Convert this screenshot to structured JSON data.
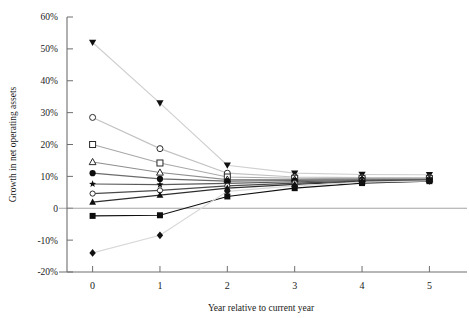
{
  "chart_data": {
    "type": "line",
    "title": "",
    "xlabel": "Year relative to current year",
    "ylabel": "Growth in net operating assets",
    "x": [
      0,
      1,
      2,
      3,
      4,
      5
    ],
    "xlim": [
      -0.38,
      5.38
    ],
    "ylim": [
      -20,
      60
    ],
    "grid": false,
    "legend": "none",
    "xtick_labels": [
      "0",
      "1",
      "2",
      "3",
      "4",
      "5"
    ],
    "ytick_values": [
      60,
      50,
      40,
      30,
      20,
      10,
      0,
      -10,
      -20
    ],
    "ytick_labels": [
      "60%",
      "50%",
      "40%",
      "30%",
      "20%",
      "10%",
      "0",
      "-10%",
      "-20%"
    ],
    "series": [
      {
        "name": "decile-10",
        "marker": "triangle-down-filled",
        "color": "#cfcfcf",
        "marker_color": "#101010",
        "values": [
          52.0,
          33.0,
          13.5,
          11.0,
          10.6,
          10.5
        ]
      },
      {
        "name": "decile-9",
        "marker": "circle-open",
        "color": "#c2c2c2",
        "marker_color": "#2a2a2a",
        "values": [
          28.5,
          18.7,
          11.0,
          9.8,
          9.6,
          9.6
        ]
      },
      {
        "name": "decile-8",
        "marker": "square-open",
        "color": "#a8a8a8",
        "marker_color": "#2a2a2a",
        "values": [
          20.0,
          14.2,
          9.8,
          9.4,
          9.3,
          9.3
        ]
      },
      {
        "name": "decile-7",
        "marker": "triangle-up-open",
        "color": "#8e8e8e",
        "marker_color": "#2a2a2a",
        "values": [
          14.5,
          11.2,
          9.0,
          9.0,
          9.1,
          9.1
        ]
      },
      {
        "name": "decile-6",
        "marker": "circle-filled",
        "color": "#6b6b6b",
        "marker_color": "#0d0d0d",
        "values": [
          11.0,
          9.2,
          8.5,
          8.7,
          8.9,
          9.0
        ]
      },
      {
        "name": "decile-5",
        "marker": "star-filled",
        "color": "#5a5a5a",
        "marker_color": "#0d0d0d",
        "values": [
          7.6,
          7.4,
          7.8,
          8.3,
          8.7,
          8.9
        ]
      },
      {
        "name": "decile-4",
        "marker": "circle-open-small",
        "color": "#4a4a4a",
        "marker_color": "#2a2a2a",
        "values": [
          4.6,
          5.6,
          7.0,
          7.9,
          8.5,
          8.8
        ]
      },
      {
        "name": "decile-3",
        "marker": "triangle-up-filled",
        "color": "#2e2e2e",
        "marker_color": "#0d0d0d",
        "values": [
          1.9,
          4.1,
          6.3,
          7.5,
          8.3,
          8.7
        ]
      },
      {
        "name": "decile-2",
        "marker": "square-filled",
        "color": "#111111",
        "marker_color": "#0d0d0d",
        "values": [
          -2.4,
          -2.2,
          3.7,
          6.3,
          7.9,
          8.5
        ]
      },
      {
        "name": "decile-1",
        "marker": "diamond-filled",
        "color": "#d8d8d8",
        "marker_color": "#111111",
        "values": [
          -14.0,
          -8.5,
          5.3,
          7.0,
          8.2,
          8.6
        ]
      }
    ]
  },
  "axes": {
    "y_label": "Growth in net operating assets",
    "x_label": "Year relative to current year"
  }
}
